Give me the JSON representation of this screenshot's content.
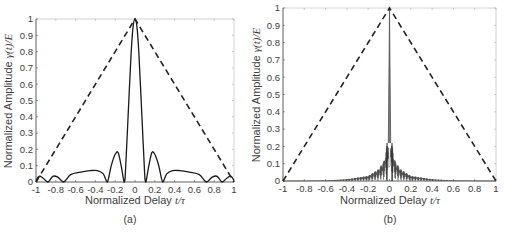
{
  "figure": {
    "panels": [
      {
        "id": "a",
        "caption": "(a)",
        "xlabel_text": "Normalized Delay ",
        "xlabel_math": "t/τ",
        "ylabel_text": "Normalized Amplitude ",
        "ylabel_math": "γ(t)/E",
        "xticks": [
          "-1",
          "-0.8",
          "-0.6",
          "-0.4",
          "-0.2",
          "0",
          "0.2",
          "0.4",
          "0.6",
          "0.8",
          "1"
        ],
        "yticks": [
          "0",
          "0.1",
          "0.2",
          "0.3",
          "0.4",
          "0.5",
          "0.6",
          "0.7",
          "0.8",
          "0.9",
          "1"
        ]
      },
      {
        "id": "b",
        "caption": "(b)",
        "xlabel_text": "Normalized Delay ",
        "xlabel_math": "t/τ",
        "ylabel_text": "Normalized Amplitude ",
        "ylabel_math": "γ(t)/E",
        "xticks": [
          "-1",
          "-0.8",
          "-0.6",
          "-0.4",
          "-0.2",
          "0",
          "0.2",
          "0.4",
          "0.6",
          "0.8",
          "1"
        ],
        "yticks": [
          "0",
          "0.1",
          "0.2",
          "0.3",
          "0.4",
          "0.5",
          "0.6",
          "0.7",
          "0.8",
          "0.9",
          "1"
        ]
      }
    ]
  },
  "chart_data": [
    {
      "type": "line",
      "panel": "(a)",
      "title": "",
      "xlabel": "Normalized Delay t/τ",
      "ylabel": "Normalized Amplitude γ(t)/E",
      "xlim": [
        -1,
        1
      ],
      "ylim": [
        0,
        1
      ],
      "grid": false,
      "legend": null,
      "series": [
        {
          "name": "Autocorrelation (solid)",
          "style": "solid",
          "x": [
            -1,
            -0.97,
            -0.93,
            -0.88,
            -0.83,
            -0.78,
            -0.72,
            -0.65,
            -0.55,
            -0.45,
            -0.38,
            -0.32,
            -0.28,
            -0.24,
            -0.2,
            -0.17,
            -0.14,
            -0.11,
            -0.1,
            -0.07,
            -0.04,
            -0.02,
            0,
            0.02,
            0.04,
            0.07,
            0.1,
            0.11,
            0.14,
            0.17,
            0.2,
            0.24,
            0.28,
            0.32,
            0.38,
            0.45,
            0.55,
            0.65,
            0.72,
            0.78,
            0.83,
            0.88,
            0.93,
            0.97,
            1
          ],
          "y": [
            0.01,
            0.035,
            0.025,
            0.0,
            0.035,
            0.03,
            0.0,
            0.045,
            0.06,
            0.07,
            0.07,
            0.05,
            0.0,
            0.1,
            0.17,
            0.18,
            0.1,
            0.0,
            0.02,
            0.4,
            0.78,
            0.95,
            1.0,
            0.95,
            0.78,
            0.4,
            0.02,
            0.0,
            0.1,
            0.18,
            0.17,
            0.1,
            0.0,
            0.05,
            0.07,
            0.07,
            0.06,
            0.045,
            0.0,
            0.03,
            0.035,
            0.0,
            0.025,
            0.035,
            0.01
          ]
        },
        {
          "name": "Triangle envelope (dashed)",
          "style": "dashed",
          "x": [
            -1,
            0,
            1
          ],
          "y": [
            0,
            1,
            0
          ]
        }
      ]
    },
    {
      "type": "line",
      "panel": "(b)",
      "title": "",
      "xlabel": "Normalized Delay t/τ",
      "ylabel": "Normalized Amplitude γ(t)/E",
      "xlim": [
        -1,
        1
      ],
      "ylim": [
        0,
        1
      ],
      "grid": false,
      "legend": null,
      "series": [
        {
          "name": "Autocorrelation (solid, dense sidelobes)",
          "style": "solid",
          "x": [
            -1,
            -0.6,
            -0.4,
            -0.2,
            -0.1,
            -0.05,
            -0.02,
            -0.005,
            0,
            0.005,
            0.02,
            0.05,
            0.1,
            0.2,
            0.4,
            0.6,
            1
          ],
          "y": [
            0.0,
            0.003,
            0.01,
            0.03,
            0.07,
            0.12,
            0.22,
            0.22,
            1.0,
            0.22,
            0.22,
            0.12,
            0.07,
            0.03,
            0.01,
            0.003,
            0.0
          ],
          "note": "sidelobe envelope; oscillates rapidly between 0 and envelope"
        },
        {
          "name": "Triangle envelope (dashed)",
          "style": "dashed",
          "x": [
            -1,
            0,
            1
          ],
          "y": [
            0,
            1,
            0
          ]
        }
      ]
    }
  ]
}
